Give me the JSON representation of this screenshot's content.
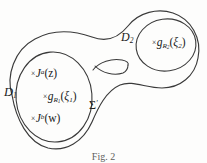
{
  "figure": {
    "caption": "Fig. 2",
    "surface": {
      "name": "sigma-prime",
      "label_text": "Σ",
      "label_prime": "′",
      "genus_marking": "handle-arc"
    },
    "regions": [
      {
        "id": "d1",
        "label_base": "D",
        "label_sub": "1",
        "description": "left disk subdomain"
      },
      {
        "id": "d2",
        "label_base": "D",
        "label_sub": "2",
        "description": "right disk subdomain"
      }
    ],
    "insertions": [
      {
        "id": "j-a-z",
        "marker": "×",
        "base": "J",
        "sup": "a",
        "arg": "(z)",
        "region": "d1"
      },
      {
        "id": "g-r1-xi1",
        "marker": "×",
        "base": "g",
        "sub": "R",
        "sub_sub": "1",
        "arg_open": "(",
        "arg_sym": "ξ",
        "arg_sub": "1",
        "arg_close": ")",
        "region": "d1"
      },
      {
        "id": "j-b-w",
        "marker": "×",
        "base": "J",
        "sup": "b",
        "arg": "(w)",
        "region": "d1"
      },
      {
        "id": "g-r2-xi2",
        "marker": "×",
        "base": "g",
        "sub": "R",
        "sub_sub": "2",
        "arg_open": "(",
        "arg_sym": "ξ",
        "arg_sub": "2",
        "arg_close": ")",
        "region": "d2"
      }
    ],
    "colors": {
      "ink": "#202020",
      "stroke": "#3a3a3a",
      "background": "#fdfdfc",
      "caption": "#5d5d5d"
    }
  }
}
